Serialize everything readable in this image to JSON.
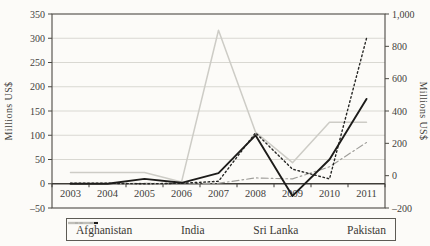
{
  "figure": {
    "background_color": "#fcfbf8",
    "frame_color": "#4c4a44",
    "gridline_color": "#d9d8d2",
    "axis_line_color": "#3f3d38"
  },
  "chart_data": {
    "type": "line",
    "title": "",
    "xlabel": "",
    "ylabel_left": "Millions US$",
    "ylabel_right": "Millions US$",
    "x_years": [
      "2003",
      "2004",
      "2005",
      "2006",
      "2007",
      "2008",
      "2009",
      "2010",
      "2011"
    ],
    "axes": {
      "left": {
        "min": -50,
        "max": 350,
        "tick_step": 50,
        "ticks": [
          350,
          300,
          250,
          200,
          150,
          100,
          50,
          0,
          -50
        ]
      },
      "right": {
        "min": -200,
        "max": 1000,
        "tick_step": 200,
        "ticks": [
          1000,
          800,
          600,
          400,
          200,
          0,
          -200
        ]
      }
    },
    "grid": true,
    "legend_position": "bottom",
    "series": [
      {
        "name": "Afghanistan",
        "axis": "left",
        "line_style": "dotted",
        "color": "#262624",
        "values": [
          1,
          1,
          0,
          1,
          5,
          105,
          30,
          10,
          300
        ]
      },
      {
        "name": "India",
        "axis": "left",
        "line_style": "solid",
        "color": "#1d1c1a",
        "values": [
          0,
          0,
          10,
          2,
          22,
          100,
          -25,
          50,
          175
        ]
      },
      {
        "name": "Sri Lanka",
        "axis": "left",
        "line_style": "dash-dot",
        "color": "#9e9d99",
        "values": [
          0,
          0,
          1,
          0,
          1,
          12,
          10,
          35,
          85
        ]
      },
      {
        "name": "Pakistan",
        "axis": "right",
        "line_style": "solid",
        "color": "#cdccc6",
        "values": [
          20,
          20,
          20,
          -40,
          900,
          270,
          80,
          330,
          330
        ]
      }
    ]
  }
}
